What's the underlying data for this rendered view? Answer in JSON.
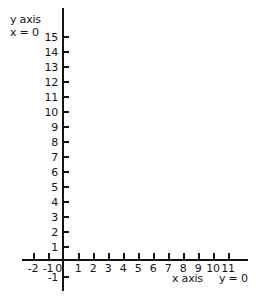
{
  "chart_data": {
    "type": "line",
    "title": "",
    "subtitle": "",
    "xlabel": "x axis",
    "ylabel": "y axis",
    "grid": false,
    "legend": null,
    "series": [],
    "x": [],
    "values": [],
    "xlim": [
      -2,
      11
    ],
    "ylim": [
      -1,
      15
    ],
    "x_ticks": [
      -2,
      -1,
      0,
      1,
      2,
      3,
      4,
      5,
      6,
      7,
      8,
      9,
      10,
      11
    ],
    "y_ticks": [
      -1,
      1,
      2,
      3,
      4,
      5,
      6,
      7,
      8,
      9,
      10,
      11,
      12,
      13,
      14,
      15
    ],
    "x_tick_labels": [
      "-2",
      "-1",
      "0",
      "1",
      "2",
      "3",
      "4",
      "5",
      "6",
      "7",
      "8",
      "9",
      "10",
      "11"
    ],
    "y_tick_labels": [
      "-1",
      "1",
      "2",
      "3",
      "4",
      "5",
      "6",
      "7",
      "8",
      "9",
      "10",
      "11",
      "12",
      "13",
      "14",
      "15"
    ],
    "annotations": [
      {
        "text": "y axis",
        "position": "top-left"
      },
      {
        "text": "x = 0",
        "position": "top-left"
      },
      {
        "text": "x axis",
        "position": "bottom-right"
      },
      {
        "text": "y = 0",
        "position": "bottom-right"
      }
    ]
  },
  "figure": {
    "y_axis_label": "y axis",
    "y_axis_equation": "x = 0",
    "x_axis_label": "x axis",
    "x_axis_equation": "y = 0",
    "axis_color": "#141414",
    "background_color": "#ffffff",
    "y_ticks": [
      {
        "value": 15,
        "label": "15",
        "top": 32
      },
      {
        "value": 14,
        "label": "14",
        "top": 47
      },
      {
        "value": 13,
        "label": "13",
        "top": 62
      },
      {
        "value": 12,
        "label": "12",
        "top": 77
      },
      {
        "value": 11,
        "label": "11",
        "top": 92
      },
      {
        "value": 10,
        "label": "10",
        "top": 107
      },
      {
        "value": 9,
        "label": "9",
        "top": 122
      },
      {
        "value": 8,
        "label": "8",
        "top": 137
      },
      {
        "value": 7,
        "label": "7",
        "top": 152
      },
      {
        "value": 6,
        "label": "6",
        "top": 167
      },
      {
        "value": 5,
        "label": "5",
        "top": 182
      },
      {
        "value": 4,
        "label": "4",
        "top": 197
      },
      {
        "value": 3,
        "label": "3",
        "top": 212
      },
      {
        "value": 2,
        "label": "2",
        "top": 227
      },
      {
        "value": 1,
        "label": "1",
        "top": 242
      },
      {
        "value": -1,
        "label": "-1",
        "top": 272
      }
    ],
    "x_ticks": [
      {
        "value": -2,
        "label": "-2",
        "left": 33
      },
      {
        "value": -1,
        "label": "-1",
        "left": 48
      },
      {
        "value": 0,
        "label": "0",
        "left": 63
      },
      {
        "value": 1,
        "label": "1",
        "left": 78
      },
      {
        "value": 2,
        "label": "2",
        "left": 93
      },
      {
        "value": 3,
        "label": "3",
        "left": 108
      },
      {
        "value": 4,
        "label": "4",
        "left": 123
      },
      {
        "value": 5,
        "label": "5",
        "left": 138
      },
      {
        "value": 6,
        "label": "6",
        "left": 153
      },
      {
        "value": 7,
        "label": "7",
        "left": 168
      },
      {
        "value": 8,
        "label": "8",
        "left": 183
      },
      {
        "value": 9,
        "label": "9",
        "left": 198
      },
      {
        "value": 10,
        "label": "10",
        "left": 213
      },
      {
        "value": 11,
        "label": "11",
        "left": 228
      }
    ]
  }
}
